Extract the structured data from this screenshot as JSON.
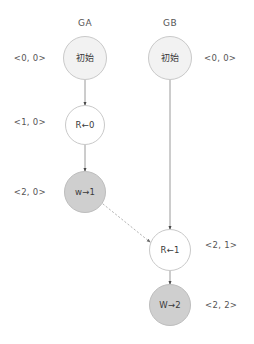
{
  "diagram": {
    "columns": [
      {
        "id": "GA",
        "label": "GA",
        "x": 85,
        "header_y": 18
      },
      {
        "id": "GB",
        "label": "GB",
        "x": 170,
        "header_y": 18
      }
    ],
    "nodes": [
      {
        "id": "ga-initial",
        "column": "GA",
        "label": "初始",
        "script": "cjk",
        "cx": 85,
        "cy": 58,
        "r": 22,
        "fill": "#f2f2f2",
        "stroke": "#c9c9c9"
      },
      {
        "id": "ga-read-0",
        "column": "GA",
        "label": "R←0",
        "script": "latin",
        "cx": 85,
        "cy": 125,
        "r": 20,
        "fill": "#ffffff",
        "stroke": "#c9c9c9"
      },
      {
        "id": "ga-write-1",
        "column": "GA",
        "label": "w→1",
        "script": "latin",
        "cx": 85,
        "cy": 192,
        "r": 21,
        "fill": "#cfcfcf",
        "stroke": "#bdbdbd"
      },
      {
        "id": "gb-initial",
        "column": "GB",
        "label": "初始",
        "script": "cjk",
        "cx": 170,
        "cy": 58,
        "r": 22,
        "fill": "#f2f2f2",
        "stroke": "#c9c9c9"
      },
      {
        "id": "gb-read-1",
        "column": "GB",
        "label": "R←1",
        "script": "latin",
        "cx": 170,
        "cy": 250,
        "r": 21,
        "fill": "#ffffff",
        "stroke": "#c9c9c9"
      },
      {
        "id": "gb-write-2",
        "column": "GB",
        "label": "W→2",
        "script": "latin",
        "cx": 170,
        "cy": 305,
        "r": 21,
        "fill": "#cfcfcf",
        "stroke": "#bdbdbd"
      }
    ],
    "edges": [
      {
        "id": "edge-ga-initial-to-read0",
        "from": "ga-initial",
        "to": "ga-read-0",
        "style": "solid",
        "x1": 85,
        "y1": 80,
        "x2": 85,
        "y2": 105,
        "color": "#9a9a9a"
      },
      {
        "id": "edge-ga-read0-to-write1",
        "from": "ga-read-0",
        "to": "ga-write-1",
        "style": "solid",
        "x1": 85,
        "y1": 145,
        "x2": 85,
        "y2": 171,
        "color": "#9a9a9a"
      },
      {
        "id": "edge-gb-initial-to-read1",
        "from": "gb-initial",
        "to": "gb-read-1",
        "style": "solid",
        "x1": 170,
        "y1": 80,
        "x2": 170,
        "y2": 229,
        "color": "#9a9a9a"
      },
      {
        "id": "edge-gb-read1-to-write2",
        "from": "gb-read-1",
        "to": "gb-write-2",
        "style": "solid",
        "x1": 170,
        "y1": 271,
        "x2": 170,
        "y2": 284,
        "color": "#9a9a9a"
      },
      {
        "id": "edge-message-ga-write1-to-gb-read1",
        "from": "ga-write-1",
        "to": "gb-read-1",
        "style": "dotted",
        "x1": 103,
        "y1": 204,
        "x2": 150,
        "y2": 242,
        "color": "#b5b5b5"
      }
    ],
    "clock_labels": [
      {
        "id": "clock-ga-initial",
        "node": "ga-initial",
        "text": "<0, 0>",
        "side": "left",
        "x": 46,
        "y": 58
      },
      {
        "id": "clock-ga-read-0",
        "node": "ga-read-0",
        "text": "<1, 0>",
        "side": "left",
        "x": 46,
        "y": 122
      },
      {
        "id": "clock-ga-write-1",
        "node": "ga-write-1",
        "text": "<2, 0>",
        "side": "left",
        "x": 46,
        "y": 192
      },
      {
        "id": "clock-gb-initial",
        "node": "gb-initial",
        "text": "<0, 0>",
        "side": "right",
        "x": 204,
        "y": 58
      },
      {
        "id": "clock-gb-read-1",
        "node": "gb-read-1",
        "text": "<2, 1>",
        "side": "right",
        "x": 205,
        "y": 245
      },
      {
        "id": "clock-gb-write-2",
        "node": "gb-write-2",
        "text": "<2, 2>",
        "side": "right",
        "x": 205,
        "y": 305
      }
    ]
  }
}
